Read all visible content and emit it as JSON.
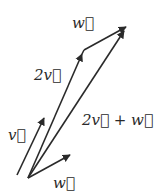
{
  "diagram": {
    "type": "vector-addition",
    "colors": {
      "stroke": "#2a2a2a",
      "background": "#ffffff"
    },
    "labels": {
      "v": "v⃗",
      "two_v": "2v⃗",
      "w_top": "w⃗",
      "w_bottom": "w⃗",
      "sum": "2v⃗ + w⃗"
    },
    "vectors": [
      {
        "name": "v",
        "from": [
          17,
          175
        ],
        "to": [
          44,
          118
        ]
      },
      {
        "name": "2v",
        "from": [
          28,
          178
        ],
        "to": [
          84,
          50
        ]
      },
      {
        "name": "w",
        "from": [
          28,
          178
        ],
        "to": [
          70,
          155
        ]
      },
      {
        "name": "w-translated",
        "from": [
          84,
          50
        ],
        "to": [
          126,
          27
        ]
      },
      {
        "name": "2v+w",
        "from": [
          28,
          178
        ],
        "to": [
          126,
          27
        ]
      }
    ]
  }
}
